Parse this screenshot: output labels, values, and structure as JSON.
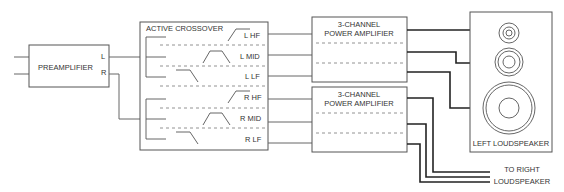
{
  "diagram": {
    "preamplifier": {
      "label": "PREAMPLIFIER",
      "out_left": "L",
      "out_right": "R"
    },
    "crossover": {
      "title": "ACTIVE CROSSOVER",
      "outputs": [
        "L HF",
        "L MID",
        "L LF",
        "R HF",
        "R MID",
        "R LF"
      ]
    },
    "amplifiers": [
      {
        "line1": "3-CHANNEL",
        "line2": "POWER AMPLIFIER"
      },
      {
        "line1": "3-CHANNEL",
        "line2": "POWER AMPLIFIER"
      }
    ],
    "speaker": {
      "label": "LEFT LOUDSPEAKER"
    },
    "right_note": {
      "line1": "TO RIGHT",
      "line2": "LOUDSPEAKER"
    }
  }
}
